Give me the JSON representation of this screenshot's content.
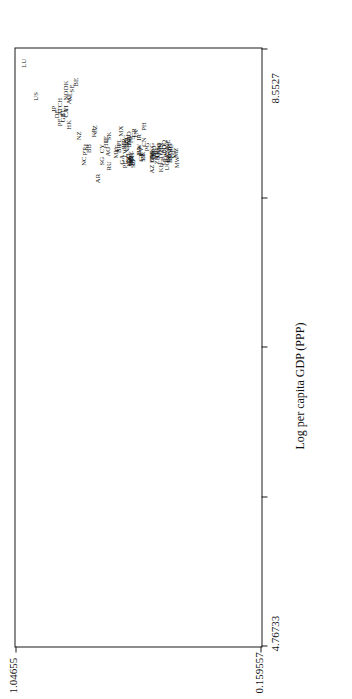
{
  "chart_data": {
    "type": "scatter",
    "title": "",
    "xlabel": "Log per capita GDP (PPP)",
    "ylabel": "",
    "xlim": [
      4.76733,
      8.5527
    ],
    "ylim": [
      0.159557,
      1.04655
    ],
    "xticks": [
      "4.76733",
      "8.5527"
    ],
    "yticks": [
      "0.159557",
      "1.04655"
    ],
    "grid": false,
    "legend": "none",
    "point_label_style": "country-code",
    "points": [
      {
        "label": "LU",
        "x": 8.46,
        "y": 1.013
      },
      {
        "label": "US",
        "x": 8.25,
        "y": 0.971
      },
      {
        "label": "JP",
        "x": 8.17,
        "y": 0.905
      },
      {
        "label": "DE",
        "x": 8.14,
        "y": 0.896
      },
      {
        "label": "AT",
        "x": 8.155,
        "y": 0.884
      },
      {
        "label": "CH",
        "x": 8.21,
        "y": 0.884
      },
      {
        "label": "GB",
        "x": 8.115,
        "y": 0.874
      },
      {
        "label": "IT",
        "x": 8.145,
        "y": 0.874
      },
      {
        "label": "CA",
        "x": 8.145,
        "y": 0.862
      },
      {
        "label": "FI",
        "x": 8.175,
        "y": 0.862
      },
      {
        "label": "AU",
        "x": 8.23,
        "y": 0.852
      },
      {
        "label": "NO",
        "x": 8.255,
        "y": 0.861
      },
      {
        "label": "NL",
        "x": 8.25,
        "y": 0.847
      },
      {
        "label": "SE",
        "x": 8.3,
        "y": 0.84
      },
      {
        "label": "DK",
        "x": 8.32,
        "y": 0.861
      },
      {
        "label": "BE",
        "x": 8.34,
        "y": 0.827
      },
      {
        "label": "PF",
        "x": 8.085,
        "y": 0.886
      },
      {
        "label": "HK",
        "x": 8.07,
        "y": 0.853
      },
      {
        "label": "NZ",
        "x": 8.0,
        "y": 0.816
      },
      {
        "label": "SI",
        "x": 7.93,
        "y": 0.789
      },
      {
        "label": "PT",
        "x": 7.9,
        "y": 0.795
      },
      {
        "label": "BB",
        "x": 7.92,
        "y": 0.779
      },
      {
        "label": "NC",
        "x": 7.84,
        "y": 0.797
      },
      {
        "label": "CZ",
        "x": 8.04,
        "y": 0.757
      },
      {
        "label": "KR",
        "x": 8.02,
        "y": 0.763
      },
      {
        "label": "CY",
        "x": 7.92,
        "y": 0.733
      },
      {
        "label": "HU",
        "x": 7.95,
        "y": 0.72
      },
      {
        "label": "IE",
        "x": 7.98,
        "y": 0.718
      },
      {
        "label": "SK",
        "x": 8.0,
        "y": 0.707
      },
      {
        "label": "AG",
        "x": 7.9,
        "y": 0.713
      },
      {
        "label": "SG",
        "x": 7.84,
        "y": 0.733
      },
      {
        "label": "AR",
        "x": 7.73,
        "y": 0.747
      },
      {
        "label": "RU",
        "x": 7.81,
        "y": 0.709
      },
      {
        "label": "MU",
        "x": 7.89,
        "y": 0.681
      },
      {
        "label": "IT2",
        "x": 7.92,
        "y": 0.679
      },
      {
        "label": "BR",
        "x": 7.92,
        "y": 0.673
      },
      {
        "label": "PL",
        "x": 7.96,
        "y": 0.672
      },
      {
        "label": "MX",
        "x": 8.03,
        "y": 0.664
      },
      {
        "label": "EE",
        "x": 7.94,
        "y": 0.655
      },
      {
        "label": "HR",
        "x": 7.955,
        "y": 0.652
      },
      {
        "label": "BG",
        "x": 7.98,
        "y": 0.648
      },
      {
        "label": "RO",
        "x": 8.0,
        "y": 0.637
      },
      {
        "label": "LT",
        "x": 7.925,
        "y": 0.646
      },
      {
        "label": "UY",
        "x": 7.935,
        "y": 0.644
      },
      {
        "label": "LV",
        "x": 7.89,
        "y": 0.65
      },
      {
        "label": "BY",
        "x": 7.955,
        "y": 0.634
      },
      {
        "label": "DZ",
        "x": 7.965,
        "y": 0.634
      },
      {
        "label": "TR",
        "x": 7.975,
        "y": 0.63
      },
      {
        "label": "PE",
        "x": 7.82,
        "y": 0.65
      },
      {
        "label": "GA",
        "x": 7.85,
        "y": 0.659
      },
      {
        "label": "CO",
        "x": 7.86,
        "y": 0.64
      },
      {
        "label": "LC",
        "x": 7.855,
        "y": 0.634
      },
      {
        "label": "BZ",
        "x": 7.85,
        "y": 0.628
      },
      {
        "label": "TH",
        "x": 7.865,
        "y": 0.624
      },
      {
        "label": "VE",
        "x": 7.875,
        "y": 0.63
      },
      {
        "label": "CL",
        "x": 7.845,
        "y": 0.636
      },
      {
        "label": "KN",
        "x": 7.835,
        "y": 0.634
      },
      {
        "label": "DO",
        "x": 7.842,
        "y": 0.628
      },
      {
        "label": "VC",
        "x": 7.836,
        "y": 0.628
      },
      {
        "label": "FJ",
        "x": 7.833,
        "y": 0.62
      },
      {
        "label": "SZ",
        "x": 7.822,
        "y": 0.622
      },
      {
        "label": "TN",
        "x": 8.01,
        "y": 0.612
      },
      {
        "label": "CR",
        "x": 8.02,
        "y": 0.617
      },
      {
        "label": "IR",
        "x": 7.99,
        "y": 0.598
      },
      {
        "label": "CV",
        "x": 7.9,
        "y": 0.593
      },
      {
        "label": "UA",
        "x": 7.905,
        "y": 0.598
      },
      {
        "label": "BW",
        "x": 7.915,
        "y": 0.601
      },
      {
        "label": "GY",
        "x": 7.868,
        "y": 0.594
      },
      {
        "label": "LK",
        "x": 7.872,
        "y": 0.586
      },
      {
        "label": "SR",
        "x": 7.862,
        "y": 0.584
      },
      {
        "label": "PH",
        "x": 8.06,
        "y": 0.582
      },
      {
        "label": "CN",
        "x": 7.96,
        "y": 0.58
      },
      {
        "label": "PG",
        "x": 7.93,
        "y": 0.569
      },
      {
        "label": "KG",
        "x": 7.925,
        "y": 0.552
      },
      {
        "label": "MD",
        "x": 7.905,
        "y": 0.546
      },
      {
        "label": "NI",
        "x": 7.875,
        "y": 0.553
      },
      {
        "label": "HN",
        "x": 7.882,
        "y": 0.55
      },
      {
        "label": "BO",
        "x": 7.857,
        "y": 0.551
      },
      {
        "label": "CM",
        "x": 7.866,
        "y": 0.554
      },
      {
        "label": "AZ",
        "x": 7.79,
        "y": 0.554
      },
      {
        "label": "CI",
        "x": 7.876,
        "y": 0.539
      },
      {
        "label": "IN",
        "x": 7.884,
        "y": 0.536
      },
      {
        "label": "GH",
        "x": 7.893,
        "y": 0.535
      },
      {
        "label": "ZR",
        "x": 7.846,
        "y": 0.533
      },
      {
        "label": "KM",
        "x": 7.917,
        "y": 0.529
      },
      {
        "label": "AO",
        "x": 7.928,
        "y": 0.528
      },
      {
        "label": "SN",
        "x": 7.93,
        "y": 0.519
      },
      {
        "label": "TG",
        "x": 7.88,
        "y": 0.521
      },
      {
        "label": "KH",
        "x": 7.8,
        "y": 0.521
      },
      {
        "label": "CF",
        "x": 7.838,
        "y": 0.512
      },
      {
        "label": "BD",
        "x": 7.916,
        "y": 0.511
      },
      {
        "label": "GQ",
        "x": 7.944,
        "y": 0.508
      },
      {
        "label": "RW",
        "x": 7.866,
        "y": 0.505
      },
      {
        "label": "ZM",
        "x": 7.896,
        "y": 0.498
      },
      {
        "label": "UG",
        "x": 7.812,
        "y": 0.497
      },
      {
        "label": "BI",
        "x": 7.853,
        "y": 0.496
      },
      {
        "label": "TD",
        "x": 7.857,
        "y": 0.492
      },
      {
        "label": "NE",
        "x": 7.948,
        "y": 0.494
      },
      {
        "label": "BF",
        "x": 7.934,
        "y": 0.492
      },
      {
        "label": "MG",
        "x": 7.919,
        "y": 0.489
      },
      {
        "label": "SL",
        "x": 7.923,
        "y": 0.483
      },
      {
        "label": "BU",
        "x": 7.858,
        "y": 0.488
      },
      {
        "label": "NG",
        "x": 7.879,
        "y": 0.487
      },
      {
        "label": "ML",
        "x": 7.887,
        "y": 0.475
      },
      {
        "label": "MZ",
        "x": 7.894,
        "y": 0.466
      },
      {
        "label": "MW",
        "x": 7.833,
        "y": 0.463
      }
    ]
  },
  "axis": {
    "x_title": "Log per capita GDP (PPP)",
    "x_min_label": "4.76733",
    "x_max_label": "8.5527",
    "y_min_label": "0.159557",
    "y_max_label": "1.04655"
  }
}
